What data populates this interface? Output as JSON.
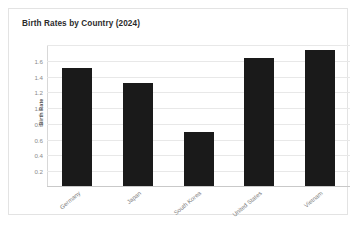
{
  "card": {
    "title": "Birth Rates by Country (2024)"
  },
  "chart_data": {
    "type": "bar",
    "title": "Birth Rates by Country (2024)",
    "xlabel": "",
    "ylabel": "Birth Rate",
    "categories": [
      "Germany",
      "Japan",
      "South Korea",
      "United States",
      "Vietnam"
    ],
    "values": [
      1.5,
      1.3,
      0.68,
      1.62,
      1.72
    ],
    "series": [
      {
        "name": "Birth Rate",
        "values": [
          1.5,
          1.3,
          0.68,
          1.62,
          1.72
        ]
      }
    ],
    "ylim": [
      0,
      1.8
    ],
    "yticks": [
      0.2,
      0.4,
      0.6,
      0.8,
      1.0,
      1.2,
      1.4,
      1.6
    ],
    "ytick_labels": [
      "0.2",
      "0.4",
      "0.6",
      "0.8",
      "1.0",
      "1.2",
      "1.4",
      "1.6"
    ],
    "gridlines": [
      0.2,
      0.4,
      0.6,
      0.8,
      1.0,
      1.2,
      1.4,
      1.6,
      1.8
    ],
    "grid": true,
    "legend": false,
    "legend_position": "none",
    "bar_color": "#1a1a1a",
    "grid_color": "#e8e8e8",
    "axis_color": "#c9c9c9",
    "title_color": "#2b2b2b",
    "tick_label_color": "#8a8a8a",
    "xtick_rotation_degrees": -40
  }
}
